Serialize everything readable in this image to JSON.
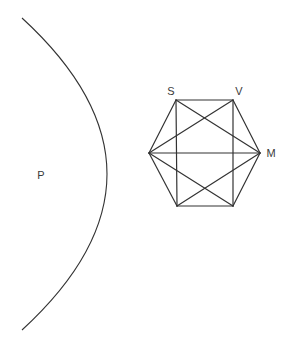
{
  "diagram": {
    "stroke_color": "#333333",
    "background": "#ffffff",
    "labels": {
      "p": "P",
      "s": "S",
      "v": "V",
      "m": "M"
    },
    "label_positions": {
      "p": [
        41,
        175
      ],
      "s": [
        171,
        91
      ],
      "v": [
        239,
        91
      ],
      "m": [
        271,
        153
      ]
    },
    "arc": {
      "start": [
        22,
        18
      ],
      "control_note": "bulges right to ~x=107 at y=175",
      "end": [
        22,
        330
      ]
    },
    "hexagon": {
      "vertices": {
        "top_left": [
          176,
          100
        ],
        "top_right": [
          233,
          100
        ],
        "right": [
          260,
          153
        ],
        "bottom_right": [
          233,
          206
        ],
        "bottom_left": [
          177,
          206
        ],
        "left": [
          149,
          153
        ]
      },
      "edges": [
        [
          "top_left",
          "top_right"
        ],
        [
          "top_right",
          "right"
        ],
        [
          "right",
          "bottom_right"
        ],
        [
          "bottom_right",
          "bottom_left"
        ],
        [
          "bottom_left",
          "left"
        ],
        [
          "left",
          "top_left"
        ],
        [
          "top_left",
          "bottom_left"
        ],
        [
          "top_right",
          "bottom_right"
        ],
        [
          "left",
          "right"
        ],
        [
          "top_left",
          "right"
        ],
        [
          "top_right",
          "left"
        ],
        [
          "bottom_left",
          "right"
        ],
        [
          "bottom_right",
          "left"
        ]
      ]
    }
  }
}
